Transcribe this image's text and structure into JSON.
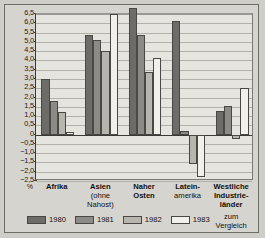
{
  "chart_data": {
    "type": "bar",
    "title": "",
    "xlabel": "",
    "ylabel": "%",
    "ylim": [
      -2.5,
      6.5
    ],
    "ytick_step": 0.5,
    "grid": true,
    "legend_position": "bottom-left",
    "categories": [
      {
        "main": "Afrika",
        "sub": "",
        "sub2": "",
        "note": ""
      },
      {
        "main": "Asien",
        "sub": "(ohne",
        "sub2": "Nahost)",
        "note": ""
      },
      {
        "main": "Naher",
        "sub": "Osten",
        "sub2": "",
        "note": ""
      },
      {
        "main": "Latein-",
        "sub": "amerika",
        "sub2": "",
        "note": ""
      },
      {
        "main": "Westliche",
        "sub": "Industrie-",
        "sub2": "länder",
        "note": "zum\nVergleich"
      }
    ],
    "category_labels": [
      "Afrika",
      "Asien (ohne Nahost)",
      "Naher Osten",
      "Latein-amerika",
      "Westliche Industrieländer"
    ],
    "yticks": [
      "6,5",
      "6,0",
      "5,5",
      "5,0",
      "4,5",
      "4,0",
      "3,5",
      "3,0",
      "2,5",
      "2,0",
      "1,5",
      "1,0",
      "0,5",
      "0",
      "−0,5",
      "−1,0",
      "−1,5",
      "−2,0",
      "−2,5"
    ],
    "series": [
      {
        "name": "1980",
        "color": "#6e6c68",
        "values": [
          3.0,
          5.35,
          6.8,
          6.1,
          1.25
        ]
      },
      {
        "name": "1981",
        "color": "#8d8b86",
        "values": [
          1.8,
          5.1,
          5.35,
          0.2,
          1.55
        ]
      },
      {
        "name": "1982",
        "color": "#b8b5af",
        "values": [
          1.2,
          4.5,
          3.4,
          -1.6,
          -0.25
        ]
      },
      {
        "name": "1983",
        "color": "#f2f0eb",
        "values": [
          0.15,
          6.5,
          4.15,
          -2.3,
          2.5
        ]
      }
    ],
    "axis_unit_label": "%",
    "comparison_note": "zum Vergleich"
  },
  "legend": {
    "items": [
      {
        "label": "1980"
      },
      {
        "label": "1981"
      },
      {
        "label": "1982"
      },
      {
        "label": "1983"
      }
    ]
  }
}
